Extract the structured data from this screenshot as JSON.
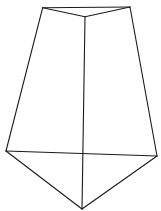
{
  "figure": {
    "stroke_color": "#1a1a1a",
    "background": "#ffffff",
    "vertices": {
      "top_left": [
        42.7,
        7.7
      ],
      "top_right": [
        130,
        7
      ],
      "top_front": [
        85,
        16.7
      ],
      "bottom_left": [
        6,
        151
      ],
      "bottom_right": [
        157,
        156
      ],
      "bottom_front": [
        82,
        209
      ]
    },
    "edges": [
      [
        "top_left",
        "top_right"
      ],
      [
        "top_left",
        "top_front"
      ],
      [
        "top_right",
        "top_front"
      ],
      [
        "top_left",
        "bottom_left"
      ],
      [
        "top_right",
        "bottom_right"
      ],
      [
        "top_front",
        "bottom_front"
      ],
      [
        "bottom_left",
        "bottom_right"
      ],
      [
        "bottom_left",
        "bottom_front"
      ],
      [
        "bottom_right",
        "bottom_front"
      ]
    ]
  }
}
